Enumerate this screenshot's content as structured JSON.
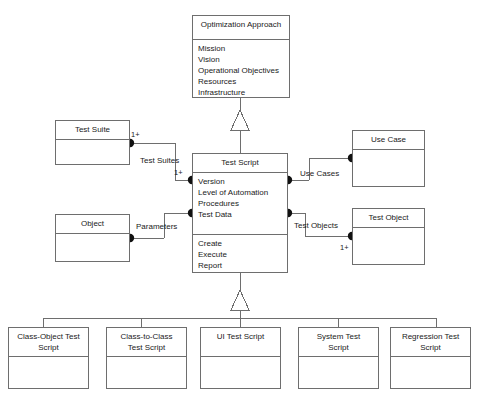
{
  "diagram": {
    "type": "uml-class-diagram",
    "line_color": "#6e6e6e",
    "text_color": "#1a1a1a",
    "background": "#ffffff",
    "classes": {
      "optimization_approach": {
        "name": "Optimization Approach",
        "attributes": "Mission\nVision\nOperational Objectives\nResources\nInfrastructure"
      },
      "test_script": {
        "name": "Test Script",
        "attributes": "Version\nLevel of Automation\nProcedures\nTest Data",
        "operations": "Create\nExecute\nReport"
      },
      "test_suite": {
        "name": "Test Suite"
      },
      "object": {
        "name": "Object"
      },
      "use_case": {
        "name": "Use Case"
      },
      "test_object": {
        "name": "Test Object"
      },
      "class_object_test_script": {
        "name": "Class-Object Test\nScript"
      },
      "class_to_class_test_script": {
        "name": "Class-to-Class\nTest Script"
      },
      "ui_test_script": {
        "name": "UI Test Script"
      },
      "system_test_script": {
        "name": "System Test\nScript"
      },
      "regression_test_script": {
        "name": "Regression Test\nScript"
      }
    },
    "associations": {
      "test_suites": {
        "label": "Test Suites",
        "source_multiplicity": "1+",
        "target_multiplicity": "1+"
      },
      "parameters": {
        "label": "Parameters"
      },
      "use_cases": {
        "label": "Use Cases"
      },
      "test_objects": {
        "label": "Test Objects",
        "target_multiplicity": "1+"
      }
    }
  }
}
